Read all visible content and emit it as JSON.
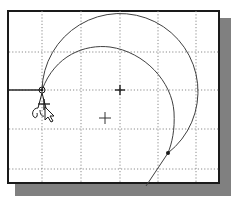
{
  "viewport": {
    "type": "cad-sketch-viewport",
    "background": "#ffffff",
    "border_color": "#1a1a1a",
    "shadow_color": "#808080"
  },
  "grid": {
    "style": "dotted",
    "color": "#8a8a8a",
    "vertical_x": [
      42,
      81,
      120,
      158,
      196
    ],
    "horizontal_y": [
      52,
      90,
      129,
      169
    ]
  },
  "sketch": {
    "line_color": "#404040",
    "horizontal_line": {
      "x1": 9,
      "y1": 90,
      "x2": 42,
      "y2": 90
    },
    "start_point": {
      "x": 42,
      "y": 90
    },
    "arc_center_mark": {
      "x": 120,
      "y": 90
    },
    "outer_arc": {
      "cx": 120,
      "cy": 90,
      "r": 78
    },
    "end_point": {
      "x": 168,
      "y": 153
    },
    "tangent_line_end": {
      "x": 146,
      "y": 186
    }
  },
  "cursor": {
    "tool": "arc-tool-cursor",
    "crosshair": {
      "x": 105,
      "y": 118
    }
  }
}
